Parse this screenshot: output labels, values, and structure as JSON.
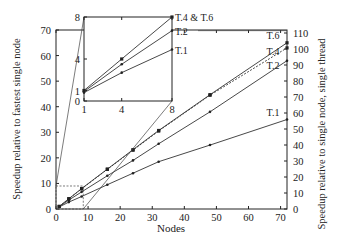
{
  "chart_data": {
    "type": "line",
    "xlabel": "Nodes",
    "ylabel_left": "Speedup relative to fastest single node",
    "ylabel_right": "Speedup relative to single node, single thread",
    "xlim": [
      0,
      72
    ],
    "ylim_left": [
      0,
      70
    ],
    "ylim_right": [
      0,
      110
    ],
    "x_ticks": [
      "0",
      "10",
      "20",
      "30",
      "40",
      "50",
      "60",
      "70"
    ],
    "x_tick_values": [
      0,
      10,
      20,
      30,
      40,
      50,
      60,
      70
    ],
    "y_ticks_left": [
      "0",
      "10",
      "20",
      "30",
      "40",
      "50",
      "60",
      "70"
    ],
    "y_tick_values_left": [
      0,
      10,
      20,
      30,
      40,
      50,
      60,
      70
    ],
    "y_ticks_right": [
      "0",
      "10",
      "20",
      "30",
      "40",
      "50",
      "60",
      "70",
      "80",
      "90",
      "100",
      "110"
    ],
    "y_tick_values_right": [
      0,
      10,
      20,
      30,
      40,
      50,
      60,
      70,
      80,
      90,
      100,
      110
    ],
    "grid": false,
    "series": [
      {
        "name": "T.1",
        "label": "T.1",
        "marker": "dot",
        "x": [
          1,
          4,
          8,
          16,
          24,
          32,
          48,
          72
        ],
        "values": [
          0.8,
          2.7,
          4.9,
          9.5,
          14,
          18.5,
          25,
          35
        ]
      },
      {
        "name": "T.2",
        "label": "T.2",
        "marker": "dot",
        "x": [
          1,
          4,
          8,
          16,
          24,
          32,
          48,
          72
        ],
        "values": [
          0.9,
          3.5,
          6.7,
          13,
          19,
          25.5,
          38,
          58
        ]
      },
      {
        "name": "T.4",
        "label": "T.4",
        "marker": "square",
        "x": [
          1,
          4,
          8,
          16,
          24,
          32,
          48,
          72
        ],
        "values": [
          1,
          4,
          7.9,
          15.5,
          23,
          30.5,
          44.5,
          63
        ]
      },
      {
        "name": "T.6",
        "label": "T.6",
        "marker": "square",
        "x": [
          1,
          4,
          8,
          16,
          24,
          32,
          48,
          72
        ],
        "values": [
          1,
          4,
          8,
          15.6,
          23.2,
          30.7,
          44.7,
          65
        ]
      }
    ],
    "inset": {
      "xlim": [
        1,
        8
      ],
      "ylim": [
        0,
        8
      ],
      "x_ticks": [
        "1",
        "4",
        "8"
      ],
      "x_tick_values": [
        1,
        4,
        8
      ],
      "y_ticks": [
        "0",
        "1",
        "4",
        "8"
      ],
      "y_tick_values": [
        0,
        1,
        4,
        8
      ],
      "labels": [
        "T.4 & T.6",
        "T.2",
        "T.1"
      ],
      "series": [
        {
          "name": "T.4 & T.6",
          "x": [
            1,
            4,
            8
          ],
          "values": [
            1,
            4,
            8
          ]
        },
        {
          "name": "T.2",
          "x": [
            1,
            4,
            8
          ],
          "values": [
            0.9,
            3.5,
            6.7
          ]
        },
        {
          "name": "T.1",
          "x": [
            1,
            4,
            8
          ],
          "values": [
            0.8,
            2.7,
            4.9
          ]
        }
      ]
    }
  }
}
